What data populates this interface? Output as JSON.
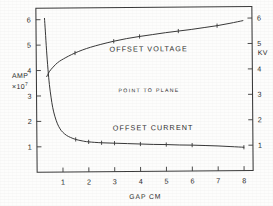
{
  "chart_data": {
    "type": "line",
    "title": "",
    "annotation": "POINT TO PLANE",
    "xlabel": "GAP  CM",
    "ylabel_left": "AMP",
    "ylabel_left_exponent_base": "×10",
    "ylabel_left_exponent_power": "7",
    "ylabel_right": "KV",
    "xlim": [
      0,
      8.35
    ],
    "ylim_left": [
      0,
      6.45
    ],
    "ylim_right": [
      0,
      6.45
    ],
    "xticks": [
      1,
      2,
      3,
      4,
      5,
      6,
      7,
      8
    ],
    "xtick_labels": [
      "1",
      "2",
      "3",
      "4",
      "5",
      "6",
      "7",
      "8"
    ],
    "yticks_left": [
      1,
      2,
      3,
      4,
      5,
      6
    ],
    "ytick_labels_left": [
      "1",
      "2",
      "3",
      "4",
      "5",
      "6"
    ],
    "yticks_right": [
      1,
      2,
      3,
      4,
      5,
      6
    ],
    "ytick_labels_right": [
      "1",
      "2",
      "3",
      "4",
      "5",
      "6"
    ],
    "grid": false,
    "legend": "inline-labels",
    "series": [
      {
        "name": "OFFSET VOLTAGE",
        "axis": "right",
        "units": "KV",
        "label_x": 4.35,
        "label_y": 4.72,
        "x": [
          0.4,
          0.5,
          0.62,
          0.75,
          0.9,
          1.05,
          1.25,
          1.5,
          1.8,
          2.1,
          2.5,
          3.0,
          3.5,
          4.0,
          4.5,
          5.0,
          5.5,
          6.0,
          6.5,
          7.0,
          7.5,
          8.0
        ],
        "y": [
          3.76,
          3.95,
          4.1,
          4.24,
          4.36,
          4.45,
          4.56,
          4.68,
          4.8,
          4.9,
          5.01,
          5.13,
          5.23,
          5.31,
          5.38,
          5.45,
          5.51,
          5.57,
          5.64,
          5.71,
          5.8,
          5.9
        ],
        "markers_x": [
          1.5,
          3.0,
          4.0,
          5.5,
          7.0
        ],
        "markers_y": [
          4.68,
          5.13,
          5.31,
          5.51,
          5.71
        ]
      },
      {
        "name": "OFFSET CURRENT",
        "axis": "left",
        "units": "AMP ×10⁷",
        "label_x": 4.5,
        "label_y": 1.62,
        "x": [
          0.33,
          0.36,
          0.4,
          0.45,
          0.5,
          0.56,
          0.62,
          0.7,
          0.8,
          0.9,
          1.0,
          1.15,
          1.3,
          1.5,
          1.75,
          2.0,
          2.5,
          3.0,
          3.5,
          4.0,
          4.5,
          5.0,
          5.5,
          6.0,
          6.5,
          7.0,
          7.5,
          8.0
        ],
        "y": [
          6.05,
          5.55,
          4.8,
          4.05,
          3.45,
          2.95,
          2.55,
          2.2,
          1.9,
          1.7,
          1.57,
          1.44,
          1.36,
          1.28,
          1.22,
          1.18,
          1.14,
          1.12,
          1.1,
          1.08,
          1.06,
          1.05,
          1.03,
          1.02,
          1.0,
          0.98,
          0.95,
          0.92
        ],
        "markers_x": [
          1.5,
          2.0,
          2.5,
          3.0,
          4.0,
          5.0,
          6.0,
          8.0
        ],
        "markers_y": [
          1.28,
          1.18,
          1.14,
          1.12,
          1.08,
          1.05,
          1.02,
          0.92
        ]
      }
    ]
  },
  "axes": {
    "x_title": "GAP  CM",
    "left_title": "AMP",
    "left_exp_base": "×10",
    "left_exp_power": "7",
    "right_title": "KV"
  },
  "labels": {
    "voltage_curve": "OFFSET VOLTAGE",
    "current_curve": "OFFSET CURRENT",
    "center_note": "POINT TO PLANE"
  },
  "colors": {
    "ink": "#2e2e2e",
    "frame": "#3a3a3a",
    "paper": "#fdfdfc"
  }
}
